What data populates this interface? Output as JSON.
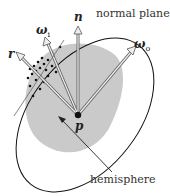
{
  "diagram": {
    "labels": {
      "normal_plane": "normal plane",
      "hemisphere": "hemisphere",
      "n": "n",
      "p": "p",
      "r": "r",
      "omega_i": "ω",
      "omega_i_sub": "i",
      "omega_o": "ω",
      "omega_o_sub": "o"
    },
    "colors": {
      "hemisphere_fill": "#c8c8c8",
      "ellipse_stroke": "#111111",
      "arrow_fill": "#e6e6e6",
      "arrow_stroke": "#666666",
      "dots": "#111111"
    },
    "point_p": [
      78,
      115
    ],
    "vectors": [
      {
        "name": "n",
        "tip": [
          78,
          32
        ]
      },
      {
        "name": "omega_i",
        "tip": [
          47,
          42
        ]
      },
      {
        "name": "r",
        "tip": [
          20,
          56
        ]
      },
      {
        "name": "omega_o",
        "tip": [
          133,
          50
        ]
      }
    ]
  }
}
